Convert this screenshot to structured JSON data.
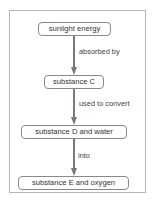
{
  "diagram": {
    "nodes": [
      {
        "id": "sunlight",
        "label": "sunlight energy"
      },
      {
        "id": "c",
        "label": "substance C"
      },
      {
        "id": "d",
        "label": "substance D and water"
      },
      {
        "id": "e",
        "label": "substance E and oxygen"
      }
    ],
    "edges": [
      {
        "from": "sunlight",
        "to": "c",
        "label": "absorbed by"
      },
      {
        "from": "c",
        "to": "d",
        "label": "used to convert"
      },
      {
        "from": "d",
        "to": "e",
        "label": "into"
      }
    ],
    "colors": {
      "arrow": "#7a7a7a",
      "border": "#8a8a8a",
      "frame": "#b5b5b5"
    }
  }
}
